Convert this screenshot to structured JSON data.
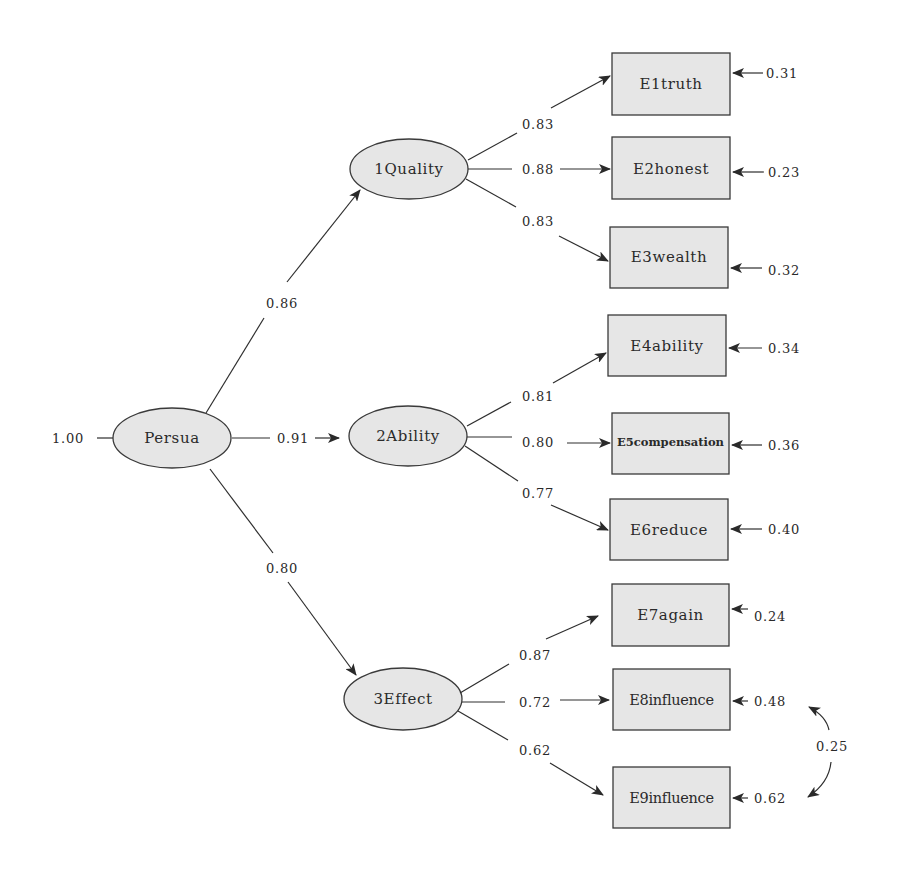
{
  "diagram": {
    "type": "structural-equation-model",
    "colors": {
      "node_fill": "#e6e6e6",
      "stroke": "#3a3a3a",
      "text": "#2a2a2a",
      "background": "#ffffff"
    },
    "top_latent": {
      "id": "persua",
      "label": "Persua",
      "variance": "1.00"
    },
    "latents": [
      {
        "id": "quality",
        "label": "1Quality",
        "loading_from_persua": "0.86"
      },
      {
        "id": "ability",
        "label": "2Ability",
        "loading_from_persua": "0.91"
      },
      {
        "id": "effect",
        "label": "3Effect",
        "loading_from_persua": "0.80"
      }
    ],
    "indicators": [
      {
        "id": "e1",
        "label": "E1truth",
        "factor": "1Quality",
        "loading": "0.83",
        "error": "0.31"
      },
      {
        "id": "e2",
        "label": "E2honest",
        "factor": "1Quality",
        "loading": "0.88",
        "error": "0.23"
      },
      {
        "id": "e3",
        "label": "E3wealth",
        "factor": "1Quality",
        "loading": "0.83",
        "error": "0.32"
      },
      {
        "id": "e4",
        "label": "E4ability",
        "factor": "2Ability",
        "loading": "0.81",
        "error": "0.34"
      },
      {
        "id": "e5",
        "label": "E5compensation",
        "factor": "2Ability",
        "loading": "0.80",
        "error": "0.36"
      },
      {
        "id": "e6",
        "label": "E6reduce",
        "factor": "2Ability",
        "loading": "0.77",
        "error": "0.40"
      },
      {
        "id": "e7",
        "label": "E7again",
        "factor": "3Effect",
        "loading": "0.87",
        "error": "0.24"
      },
      {
        "id": "e8",
        "label": "E8influence",
        "factor": "3Effect",
        "loading": "0.72",
        "error": "0.48"
      },
      {
        "id": "e9",
        "label": "E9influence",
        "factor": "3Effect",
        "loading": "0.62",
        "error": "0.62"
      }
    ],
    "error_covariances": [
      {
        "between": [
          "E8influence",
          "E9influence"
        ],
        "value": "0.25"
      }
    ]
  }
}
